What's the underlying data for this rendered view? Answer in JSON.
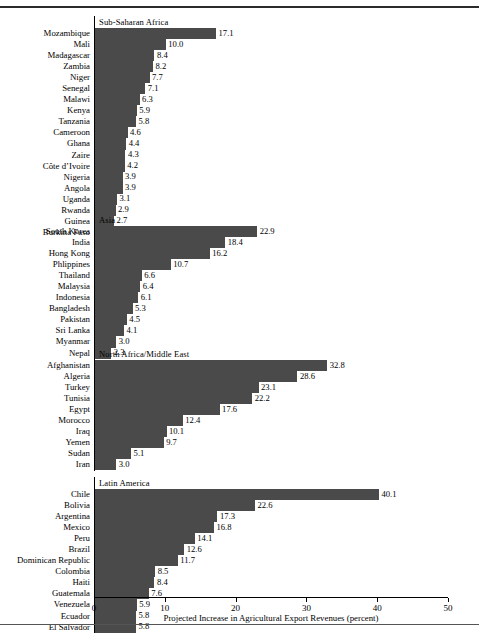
{
  "figure": {
    "xlabel": "Projected Increase in Agricultural Export Revenues (percent)"
  },
  "axis": {
    "ticks": [
      "0",
      "10",
      "20",
      "30",
      "40",
      "50"
    ],
    "min": 0,
    "max": 50
  },
  "chart_data": {
    "type": "bar",
    "orientation": "horizontal",
    "title": "",
    "xlabel": "Projected Increase in Agricultural Export Revenues (percent)",
    "ylabel": "",
    "xlim": [
      0,
      50
    ],
    "xticks": [
      0,
      10,
      20,
      30,
      40,
      50
    ],
    "grid": false,
    "legend": null,
    "bar_color": "#4a4a4a",
    "panels": [
      {
        "name": "Sub-Saharan Africa",
        "categories": [
          "Mozambique",
          "Mali",
          "Madagascar",
          "Zambia",
          "Niger",
          "Senegal",
          "Malawi",
          "Kenya",
          "Tanzania",
          "Cameroon",
          "Ghana",
          "Zaire",
          "Côte d’Ivoire",
          "Nigeria",
          "Angola",
          "Uganda",
          "Rwanda",
          "Guinea",
          "Burkina Faso"
        ],
        "values": [
          17.1,
          10.0,
          8.4,
          8.2,
          7.7,
          7.1,
          6.3,
          5.9,
          5.8,
          4.6,
          4.4,
          4.3,
          4.2,
          3.9,
          3.9,
          3.1,
          2.9,
          2.7,
          2.1
        ],
        "labels": [
          "17.1",
          "10.0",
          "8.4",
          "8.2",
          "7.7",
          "7.1",
          "6.3",
          "5.9",
          "5.8",
          "4.6",
          "4.4",
          "4.3",
          "4.2",
          "3.9",
          "3.9",
          "3.1",
          "2.9",
          "2.7",
          "2.1"
        ]
      },
      {
        "name": "Asia",
        "categories": [
          "South Korea",
          "India",
          "Hong Kong",
          "Phlippines",
          "Thailand",
          "Malaysia",
          "Indonesia",
          "Bangladesh",
          "Pakistan",
          "Sri Lanka",
          "Myanmar",
          "Nepal"
        ],
        "values": [
          22.9,
          18.4,
          16.2,
          10.7,
          6.6,
          6.4,
          6.1,
          5.3,
          4.5,
          4.1,
          3.0,
          2.3
        ],
        "labels": [
          "22.9",
          "18.4",
          "16.2",
          "10.7",
          "6.6",
          "6.4",
          "6.1",
          "5.3",
          "4.5",
          "4.1",
          "3.0",
          "2.3"
        ]
      },
      {
        "name": "North Africa/Middle East",
        "categories": [
          "Afghanistan",
          "Algeria",
          "Turkey",
          "Tunisia",
          "Egypt",
          "Morocco",
          "Iraq",
          "Yemen",
          "Sudan",
          "Iran"
        ],
        "values": [
          32.8,
          28.6,
          23.1,
          22.2,
          17.6,
          12.4,
          10.1,
          9.7,
          5.1,
          3.0
        ],
        "labels": [
          "32.8",
          "28.6",
          "23.1",
          "22.2",
          "17.6",
          "12.4",
          "10.1",
          "9.7",
          "5.1",
          "3.0"
        ]
      },
      {
        "name": "Latin America",
        "categories": [
          "Chile",
          "Bolivia",
          "Argentina",
          "Mexico",
          "Peru",
          "Brazil",
          "Dominican Republic",
          "Colombia",
          "Haiti",
          "Guatemala",
          "Venezuela",
          "Ecuador",
          "El Salvador"
        ],
        "values": [
          40.1,
          22.6,
          17.3,
          16.8,
          14.1,
          12.6,
          11.7,
          8.5,
          8.4,
          7.6,
          5.9,
          5.8,
          5.8
        ],
        "labels": [
          "40.1",
          "22.6",
          "17.3",
          "16.8",
          "14.1",
          "12.6",
          "11.7",
          "8.5",
          "8.4",
          "7.6",
          "5.9",
          "5.8",
          "5.8"
        ]
      }
    ]
  }
}
